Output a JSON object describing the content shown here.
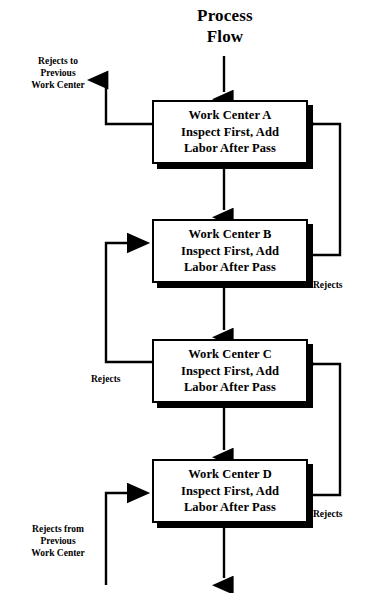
{
  "diagram": {
    "title": {
      "line1": "Process",
      "line2": "Flow"
    },
    "nodes": [
      {
        "id": "work-center-a",
        "line1": "Work Center A",
        "line2": "Inspect First, Add",
        "line3": "Labor After Pass"
      },
      {
        "id": "work-center-b",
        "line1": "Work Center B",
        "line2": "Inspect First, Add",
        "line3": "Labor After Pass"
      },
      {
        "id": "work-center-c",
        "line1": "Work Center C",
        "line2": "Inspect First, Add",
        "line3": "Labor After Pass"
      },
      {
        "id": "work-center-d",
        "line1": "Work Center D",
        "line2": "Inspect First, Add",
        "line3": "Labor After Pass"
      }
    ],
    "labels": {
      "rejects_to_previous": {
        "line1": "Rejects to",
        "line2": "Previous",
        "line3": "Work Center"
      },
      "rejects_from_previous": {
        "line1": "Rejects from",
        "line2": "Previous",
        "line3": "Work Center"
      },
      "rejects_b_to_a": "Rejects",
      "rejects_c_to_b": "Rejects",
      "rejects_d_to_c": "Rejects"
    },
    "colors": {
      "stroke": "#000000",
      "fill": "#ffffff",
      "shadow": "#000000"
    }
  }
}
